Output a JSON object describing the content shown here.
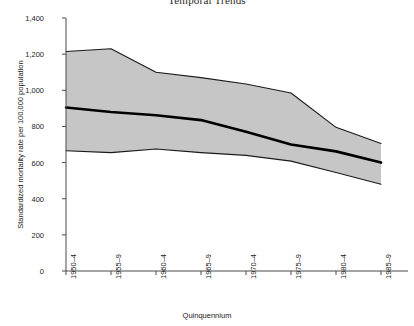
{
  "chart_data": {
    "type": "area",
    "title": "Temporal Trends",
    "xlabel": "Quinquennium",
    "ylabel": "Standardized mortality rate per 100,000 population",
    "categories": [
      "1950–4",
      "1955–9",
      "1960–4",
      "1965–9",
      "1970–4",
      "1975–9",
      "1980–4",
      "1985–9"
    ],
    "ylim": [
      0,
      1400
    ],
    "yticks": [
      0,
      200,
      400,
      600,
      800,
      1000,
      1200,
      1400
    ],
    "ytick_labels": [
      "0",
      "200",
      "400",
      "600",
      "800",
      "1,000",
      "1,200",
      "1,400"
    ],
    "grid": false,
    "legend": "none",
    "band_fill": "#c6c6c6",
    "band_edge": "#1a1a1a",
    "median_color": "#000000",
    "series": [
      {
        "name": "Upper bound",
        "values": [
          1215,
          1230,
          1100,
          1070,
          1035,
          985,
          795,
          705
        ]
      },
      {
        "name": "Median",
        "values": [
          905,
          880,
          862,
          835,
          770,
          700,
          662,
          600
        ]
      },
      {
        "name": "Lower bound",
        "values": [
          665,
          655,
          675,
          655,
          640,
          608,
          545,
          480
        ]
      }
    ]
  }
}
